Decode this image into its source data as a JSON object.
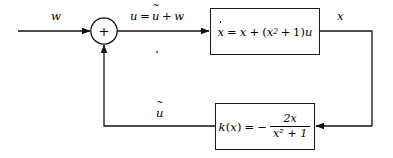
{
  "diagram": {
    "type": "control-system-block-diagram",
    "background_color": "#ffffff",
    "line_color": "#1a1a1a",
    "signals": {
      "exogenous_input": "w",
      "sum_output": "u = ũ + w",
      "plant_output": "x",
      "feedback_signal": "ũ"
    },
    "summing_junction": {
      "sign": "+",
      "inputs": [
        "w",
        "ũ"
      ],
      "output": "u"
    },
    "plant_block": {
      "state_symbol": "x",
      "derivative_label": "x",
      "equals": "=",
      "term_linear": "x",
      "plus": "+",
      "open_paren": "(",
      "quadratic_base": "x",
      "quadratic_exponent": "2",
      "inner_plus": "+",
      "inner_constant": "1",
      "close_paren": ")",
      "control_var": "u",
      "full_equation": "ẋ = x + (x² + 1)u"
    },
    "controller_block": {
      "function_name": "k",
      "open_paren": "(",
      "argument": "x",
      "close_paren": ")",
      "equals": "=",
      "minus": "−",
      "numerator": "2x",
      "denominator": "x² + 1",
      "full_equation": "k(x) = − 2x/(x² + 1)"
    }
  }
}
